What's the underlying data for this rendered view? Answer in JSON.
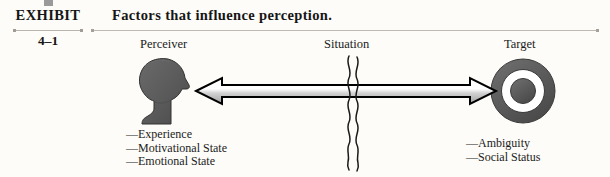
{
  "exhibit": {
    "marker_icon": "gray-square-marker",
    "label": "EXHIBIT",
    "number": "4–1",
    "title": "Factors that influence perception."
  },
  "columns": {
    "perceiver": "Perceiver",
    "situation": "Situation",
    "target": "Target"
  },
  "diagram": {
    "perceiver_icon": "head-silhouette-icon",
    "target_icon": "bullseye-target-icon",
    "situation_icon": "wavy-vertical-line-icon",
    "arrow_icon": "double-headed-horizontal-arrow-icon"
  },
  "lists": {
    "perceiver_factors": [
      "—Experience",
      "—Motivational State",
      "—Emotional State"
    ],
    "target_factors": [
      "—Ambiguity",
      "—Social Status"
    ]
  },
  "colors": {
    "page_background": "#fdfcf8",
    "text": "#161616",
    "rule": "#bdb8b2",
    "marker_square": "#9a9a9a",
    "silhouette_fill": "#5c5c5c",
    "silhouette_stroke": "#2e2e2e",
    "target_ring": "#5c5c5c",
    "target_center": "#5c5c5c",
    "target_gap": "#ffffff",
    "arrow_outline": "#000000",
    "arrow_fill_light": "#ffffff",
    "arrow_fill_shade": "#b4b4b4",
    "wave_stroke": "#1a1a1a"
  }
}
